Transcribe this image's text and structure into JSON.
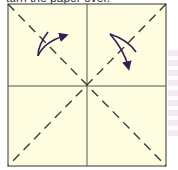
{
  "caption": "turn the paper over.",
  "colors": {
    "paper": "#fffde0",
    "outline": "#555555",
    "fold_line": "#3a3a3a",
    "arrow": "#3a1a55"
  },
  "diagram": {
    "type": "origami-step",
    "shape": "square",
    "crease_lines": [
      "vertical-center",
      "horizontal-center"
    ],
    "fold_lines_dashed": [
      "diagonal-top-left-to-bottom-right",
      "diagonal-top-right-to-bottom-left"
    ],
    "arrows": [
      {
        "name": "left-fold-arrow",
        "direction": "up-right"
      },
      {
        "name": "right-fold-arrow",
        "direction": "down"
      }
    ]
  }
}
